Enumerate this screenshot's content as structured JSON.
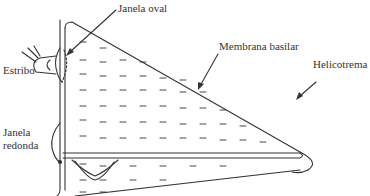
{
  "diagram": {
    "type": "cochlea-schematic",
    "labels": {
      "oval_window": "Janela oval",
      "basilar_membrane": "Membrana basilar",
      "helicotrema": "Helicotrema",
      "stapes": "Estribo",
      "round_window_line1": "Janela",
      "round_window_line2": "redonda"
    },
    "colors": {
      "line": "#333333",
      "background": "#ffffff"
    }
  }
}
